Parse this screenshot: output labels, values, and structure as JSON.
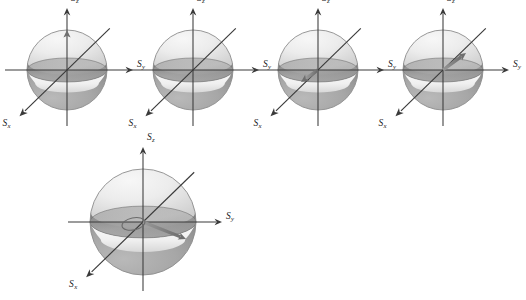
{
  "figure": {
    "kind": "spin-vector-bloch-sphere-panel",
    "background_color": "#ffffff",
    "sphere_outline_color": "#8c8c8c",
    "axis_color": "#3a3a3a",
    "vector_color": "#777777",
    "label_color": "#1a1a1a",
    "upper_shade": "#e8e8e8",
    "equator_band_shade": "#9a9a9a",
    "lower_light_band": "#efefef",
    "lower_shade": "#a6a6a6"
  },
  "axis_labels": {
    "z": "S",
    "z_sub": "z",
    "y": "S",
    "y_sub": "y",
    "x": "S",
    "x_sub": "x"
  },
  "panels": [
    {
      "id": "panel-1",
      "cx": 67,
      "cy": 70,
      "r": 40,
      "has_vector": true,
      "vector_label": "spin-up-z",
      "vector_dx": 0,
      "vector_dy": -40,
      "has_precession_ellipse": false
    },
    {
      "id": "panel-2",
      "cx": 193,
      "cy": 70,
      "r": 40,
      "has_vector": false,
      "vector_label": "none",
      "vector_dx": 0,
      "vector_dy": 0,
      "has_precession_ellipse": false
    },
    {
      "id": "panel-3",
      "cx": 318,
      "cy": 70,
      "r": 40,
      "has_vector": true,
      "vector_label": "spin-minus-x",
      "vector_dx": -17,
      "vector_dy": 12,
      "has_precession_ellipse": false
    },
    {
      "id": "panel-4",
      "cx": 443,
      "cy": 70,
      "r": 40,
      "has_vector": true,
      "vector_label": "spin-plus-x",
      "vector_dx": 23,
      "vector_dy": -17,
      "has_precession_ellipse": false
    },
    {
      "id": "panel-5",
      "cx": 143,
      "cy": 222,
      "r": 53,
      "has_vector": true,
      "vector_label": "spin-in-plane",
      "vector_dx": 43,
      "vector_dy": 17,
      "has_precession_ellipse": true
    }
  ],
  "caption": ""
}
